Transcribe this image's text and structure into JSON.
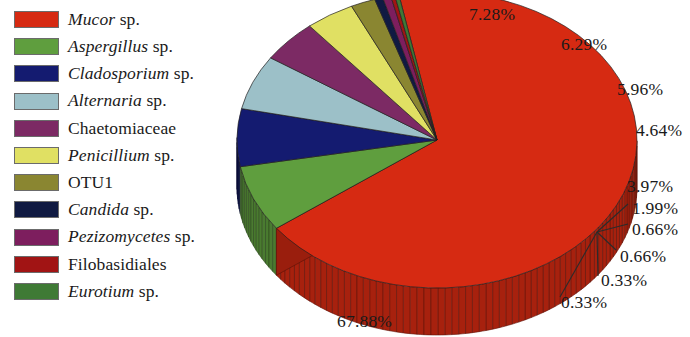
{
  "chart_data": {
    "type": "pie",
    "title": "",
    "legend_position": "left",
    "three_d": true,
    "categories": [
      "Mucor sp.",
      "Aspergillus sp.",
      "Cladosporium sp.",
      "Alternaria sp.",
      "Chaetomiaceae",
      "Penicillium sp.",
      "OTU1",
      "Candida sp.",
      "Pezizomycetes sp.",
      "Filobasidiales",
      "Eurotium sp."
    ],
    "values": [
      67.88,
      7.28,
      6.29,
      5.96,
      4.64,
      3.97,
      1.99,
      0.66,
      0.66,
      0.33,
      0.33
    ],
    "value_labels": [
      "67.88%",
      "7.28%",
      "6.29%",
      "5.96%",
      "4.64%",
      "3.97%",
      "1.99%",
      "0.66%",
      "0.66%",
      "0.33%",
      "0.33%"
    ],
    "colors": [
      "#d62a12",
      "#5f9e3e",
      "#141b70",
      "#9cc0c8",
      "#7c2a64",
      "#e0e063",
      "#8a8631",
      "#101a42",
      "#7d1e5e",
      "#a11414",
      "#3f7a35"
    ],
    "units": "percent"
  },
  "legend": {
    "items": [
      {
        "color": "#d62a12",
        "genus": "Mucor",
        "suffix": " sp.",
        "italic": true,
        "plain": ""
      },
      {
        "color": "#5f9e3e",
        "genus": "Aspergillus",
        "suffix": " sp.",
        "italic": true,
        "plain": ""
      },
      {
        "color": "#141b70",
        "genus": "Cladosporium",
        "suffix": " sp.",
        "italic": true,
        "plain": ""
      },
      {
        "color": "#9cc0c8",
        "genus": "Alternaria",
        "suffix": " sp.",
        "italic": true,
        "plain": ""
      },
      {
        "color": "#7c2a64",
        "genus": "",
        "suffix": "",
        "italic": false,
        "plain": "Chaetomiaceae"
      },
      {
        "color": "#e0e063",
        "genus": "Penicillium",
        "suffix": " sp.",
        "italic": true,
        "plain": ""
      },
      {
        "color": "#8a8631",
        "genus": "",
        "suffix": "",
        "italic": false,
        "plain": "OTU1"
      },
      {
        "color": "#101a42",
        "genus": "Candida",
        "suffix": " sp.",
        "italic": true,
        "plain": ""
      },
      {
        "color": "#7d1e5e",
        "genus": "Pezizomycetes",
        "suffix": " sp.",
        "italic": true,
        "plain": ""
      },
      {
        "color": "#a11414",
        "genus": "",
        "suffix": "",
        "italic": false,
        "plain": "Filobasidiales"
      },
      {
        "color": "#3f7a35",
        "genus": "Eurotium",
        "suffix": " sp.",
        "italic": true,
        "plain": ""
      }
    ]
  },
  "callouts": [
    {
      "text": "7.28%",
      "left": 469,
      "top": 6,
      "leader": false
    },
    {
      "text": "6.29%",
      "left": 561,
      "top": 36,
      "leader": false
    },
    {
      "text": "5.96%",
      "left": 617,
      "top": 81,
      "leader": false
    },
    {
      "text": "4.64%",
      "left": 636,
      "top": 122,
      "leader": false
    },
    {
      "text": "3.97%",
      "left": 627,
      "top": 178,
      "leader": false
    },
    {
      "text": "1.99%",
      "left": 632,
      "top": 200,
      "leader": true
    },
    {
      "text": "0.66%",
      "left": 632,
      "top": 221,
      "leader": true
    },
    {
      "text": "0.66%",
      "left": 620,
      "top": 248,
      "leader": true
    },
    {
      "text": "0.33%",
      "left": 601,
      "top": 272,
      "leader": true
    },
    {
      "text": "0.33%",
      "left": 561,
      "top": 294,
      "leader": true
    },
    {
      "text": "67.88%",
      "left": 337,
      "top": 313,
      "leader": false
    }
  ]
}
